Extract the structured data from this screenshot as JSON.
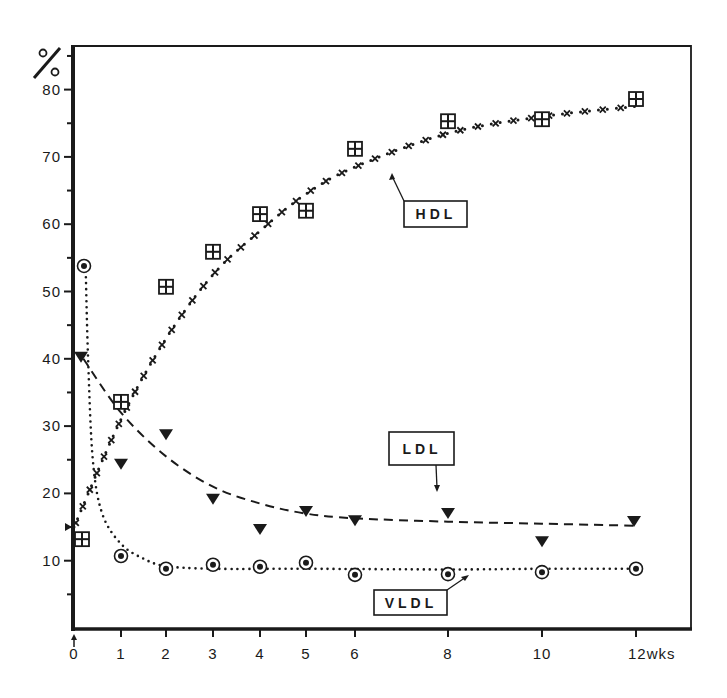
{
  "chart_data": {
    "type": "scatter",
    "title": "",
    "xlabel": "wks",
    "ylabel": "%",
    "x_ticks": [
      0,
      1,
      2,
      3,
      4,
      5,
      6,
      8,
      10,
      12
    ],
    "x_tick_labels": [
      "0",
      "1",
      "2",
      "3",
      "4",
      "5",
      "6",
      "8",
      "10",
      "12wks"
    ],
    "y_ticks": [
      10,
      20,
      30,
      40,
      50,
      60,
      70,
      80
    ],
    "y_tick_labels": [
      "10",
      "20",
      "30",
      "40",
      "50",
      "60",
      "70",
      "80"
    ],
    "xlim": [
      0,
      13
    ],
    "ylim": [
      0,
      85
    ],
    "grid": false,
    "legend": "inline labeled boxes with arrows",
    "x": [
      0,
      1,
      2,
      3,
      4,
      5,
      6,
      8,
      10,
      12
    ],
    "series": [
      {
        "name": "HDL",
        "marker": "square-with-four-dots",
        "line": "dotted with crosses",
        "values": [
          13.2,
          33.6,
          50.7,
          55.9,
          61.5,
          62.0,
          71.2,
          75.3,
          75.6,
          78.6
        ],
        "fit_curve": [
          [
            0,
            15
          ],
          [
            1,
            31
          ],
          [
            2,
            43
          ],
          [
            3,
            52.5
          ],
          [
            4,
            59
          ],
          [
            5,
            64.5
          ],
          [
            6,
            68.5
          ],
          [
            8,
            73.5
          ],
          [
            10,
            76
          ],
          [
            12,
            77.5
          ]
        ]
      },
      {
        "name": "LDL",
        "marker": "filled-triangle-down",
        "line": "dashed",
        "values": [
          40.3,
          24.4,
          28.8,
          19.2,
          14.7,
          17.4,
          16.0,
          17.1,
          12.9,
          15.9
        ],
        "fit_curve": [
          [
            0.2,
            40
          ],
          [
            1,
            32
          ],
          [
            2,
            25.5
          ],
          [
            3,
            21
          ],
          [
            4,
            18.5
          ],
          [
            5,
            17
          ],
          [
            6,
            16.3
          ],
          [
            8,
            15.8
          ],
          [
            10,
            15.5
          ],
          [
            12,
            15.2
          ]
        ]
      },
      {
        "name": "VLDL",
        "marker": "circled-dot",
        "line": "dotted",
        "values": [
          53.8,
          10.7,
          8.8,
          9.4,
          9.1,
          9.7,
          7.9,
          8.0,
          8.3,
          8.8
        ],
        "fit_curve": [
          [
            0.25,
            53
          ],
          [
            0.3,
            40
          ],
          [
            0.4,
            25
          ],
          [
            0.6,
            17
          ],
          [
            1,
            12.5
          ],
          [
            1.5,
            10.3
          ],
          [
            2,
            9.2
          ],
          [
            3,
            8.8
          ],
          [
            5,
            8.8
          ],
          [
            8,
            8.7
          ],
          [
            10,
            8.8
          ],
          [
            12,
            8.8
          ]
        ]
      }
    ],
    "annotations": [
      {
        "text": "HDL",
        "type": "boxed-label-with-arrow"
      },
      {
        "text": "LDL",
        "type": "boxed-label-with-arrow"
      },
      {
        "text": "VLDL",
        "type": "boxed-label-with-arrow"
      }
    ]
  },
  "labels": {
    "y_unit": "%",
    "hdl": "HDL",
    "ldl": "LDL",
    "vldl": "VLDL"
  },
  "layout": {
    "plot_left": 73,
    "plot_right": 691,
    "plot_top": 46,
    "plot_bottom": 629,
    "x_px": {
      "0": 74,
      "1": 121,
      "2": 166,
      "3": 213,
      "4": 260,
      "5": 306,
      "6": 355,
      "8": 448,
      "10": 542,
      "12": 636
    },
    "y0_px": 628,
    "y_px_per_unit": 6.73
  },
  "colors": {
    "ink": "#1a1a1a",
    "paper": "#ffffff"
  }
}
